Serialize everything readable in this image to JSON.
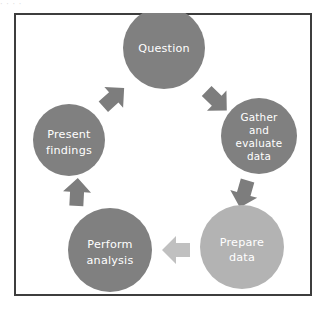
{
  "figure": {
    "type": "cycle-diagram",
    "border_color": "#3d3d3d",
    "background_color": "#ffffff",
    "top_text_artifact": "·                    ·                    ·          ·"
  },
  "palette": {
    "node_dark": "#808080",
    "node_light": "#b3b3b3",
    "arrow_dark": "#7d7d7d",
    "arrow_light": "#c0c0c0",
    "label_text": "#ffffff"
  },
  "nodes": [
    {
      "id": "question",
      "label": "Question",
      "lines": [
        "Question"
      ],
      "cx": 150,
      "cy": 35,
      "r": 41,
      "color": "#808080",
      "order": 1
    },
    {
      "id": "gather-evaluate-data",
      "label": "Gather and evaluate data",
      "lines": [
        "Gather",
        "and",
        "evaluate",
        "data"
      ],
      "cx": 245,
      "cy": 123,
      "r": 38,
      "color": "#808080",
      "order": 2
    },
    {
      "id": "prepare-data",
      "label": "Prepare data",
      "lines": [
        "Prepare",
        "data"
      ],
      "cx": 228,
      "cy": 234,
      "r": 42,
      "color": "#b3b3b3",
      "order": 3
    },
    {
      "id": "perform-analysis",
      "label": "Perform analysis",
      "lines": [
        "Perform",
        "analysis"
      ],
      "cx": 96,
      "cy": 237,
      "r": 42,
      "color": "#808080",
      "order": 4
    },
    {
      "id": "present-findings",
      "label": "Present findings",
      "lines": [
        "Present",
        "findings"
      ],
      "cx": 55,
      "cy": 127,
      "r": 36,
      "color": "#808080",
      "order": 5
    }
  ],
  "arrows": [
    {
      "id": "arrow-present-to-question",
      "from": "present-findings",
      "to": "question",
      "x": 99,
      "y": 85,
      "rotation": 48,
      "color": "#7d7d7d",
      "scale": 1.0
    },
    {
      "id": "arrow-question-to-gather",
      "from": "question",
      "to": "gather-evaluate-data",
      "x": 202,
      "y": 87,
      "rotation": 134,
      "color": "#7d7d7d",
      "scale": 1.0
    },
    {
      "id": "arrow-gather-to-prepare",
      "from": "gather-evaluate-data",
      "to": "prepare-data",
      "x": 230,
      "y": 180,
      "rotation": 196,
      "color": "#7d7d7d",
      "scale": 1.0
    },
    {
      "id": "arrow-prepare-to-perform",
      "from": "prepare-data",
      "to": "perform-analysis",
      "x": 163,
      "y": 237,
      "rotation": 270,
      "color": "#c0c0c0",
      "scale": 1.0
    },
    {
      "id": "arrow-perform-to-present",
      "from": "perform-analysis",
      "to": "present-findings",
      "x": 63,
      "y": 180,
      "rotation": 3,
      "color": "#7d7d7d",
      "scale": 1.0
    }
  ]
}
